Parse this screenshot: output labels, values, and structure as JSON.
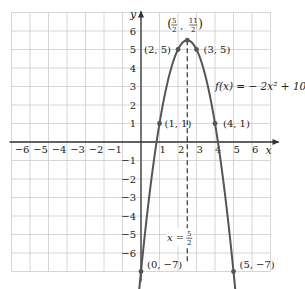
{
  "chart_data": {
    "type": "line",
    "title": "",
    "function_label": "f(x) = − 2x² + 10x − 7",
    "xlabel": "x",
    "ylabel": "y",
    "xlim": [
      -7,
      7
    ],
    "ylim": [
      -7,
      7
    ],
    "grid": true,
    "x_ticks": [
      "−6",
      "−5",
      "−4",
      "−3",
      "−2",
      "−1",
      "1",
      "2",
      "3",
      "4",
      "5",
      "6"
    ],
    "x_tick_values": [
      -6,
      -5,
      -4,
      -3,
      -2,
      -1,
      1,
      2,
      3,
      4,
      5,
      6
    ],
    "y_ticks": [
      "6",
      "5",
      "4",
      "3",
      "2",
      "1",
      "−1",
      "−2",
      "−3",
      "−4",
      "−5",
      "−6"
    ],
    "y_tick_values": [
      6,
      5,
      4,
      3,
      2,
      1,
      -1,
      -2,
      -3,
      -4,
      -5,
      -6
    ],
    "series": [
      {
        "name": "f(x) = -2x^2 + 10x - 7",
        "coefficients": {
          "a": -2,
          "b": 10,
          "c": -7
        },
        "x_range": [
          -0.1,
          5.1
        ]
      }
    ],
    "points": [
      {
        "x": 0,
        "y": -7,
        "label": "(0, −7)"
      },
      {
        "x": 1,
        "y": 1,
        "label": "(1, 1)"
      },
      {
        "x": 2,
        "y": 5,
        "label": "(2, 5)"
      },
      {
        "x": 2.5,
        "y": 5.5,
        "label": "(5/2, 11/2)"
      },
      {
        "x": 3,
        "y": 5,
        "label": "(3, 5)"
      },
      {
        "x": 4,
        "y": 1,
        "label": "(4, 1)"
      },
      {
        "x": 5,
        "y": -7,
        "label": "(5, −7)"
      }
    ],
    "axis_of_symmetry": {
      "x": 2.5,
      "label_left": "x =",
      "label_num": "5",
      "label_den": "2"
    },
    "vertex_label": {
      "num_x": "5",
      "den_x": "2",
      "num_y": "11",
      "den_y": "2"
    },
    "colors": {
      "curve": "#555555",
      "axis": "#333333",
      "grid": "#cccccc",
      "text": "#222222"
    }
  }
}
